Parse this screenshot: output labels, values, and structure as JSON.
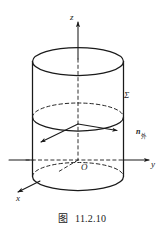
{
  "figure": {
    "caption_label": "图",
    "caption_number": "11.2.10",
    "caption_full": "图  11.2.10",
    "background_color": "#ffffff",
    "line_color": "#1a1a1a",
    "axes": [
      {
        "id": "z",
        "label": "z",
        "direction": "up"
      },
      {
        "id": "y",
        "label": "y",
        "direction": "right"
      },
      {
        "id": "x",
        "label": "x",
        "direction": "down-left"
      }
    ],
    "origin_label": "O",
    "surface_label": "Σ",
    "normal_label_base": "n",
    "normal_label_subscript": "外",
    "normal_label_full": "n外",
    "normal_vectors": [
      {
        "id": "normal-left",
        "direction": "down-left"
      },
      {
        "id": "normal-right",
        "direction": "right"
      }
    ],
    "ellipses": [
      {
        "id": "top-rim",
        "style": "solid"
      },
      {
        "id": "middle-rim",
        "style": "mixed-dashed-back-solid-front"
      },
      {
        "id": "bottom-rim",
        "style": "mixed-dashed-back-solid-front"
      }
    ]
  }
}
